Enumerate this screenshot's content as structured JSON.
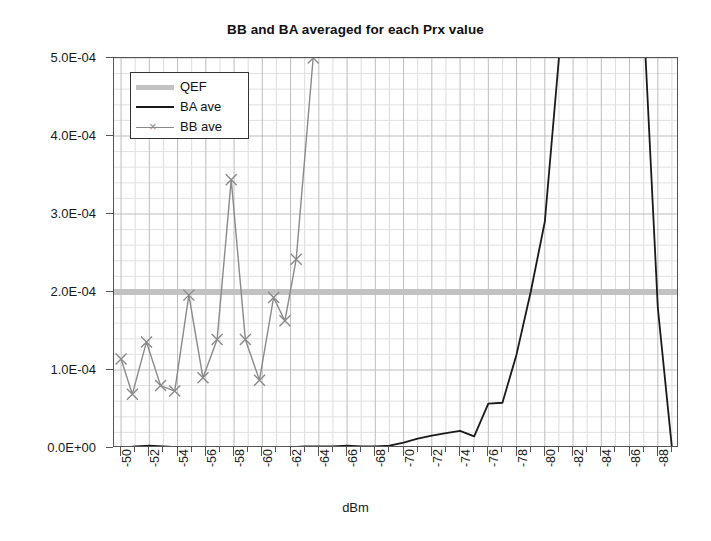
{
  "chart_data": {
    "type": "line",
    "title": "BB and BA averaged for each Prx value",
    "xlabel": "dBm",
    "ylabel": "",
    "xlim": [
      -49.5,
      -89.5
    ],
    "ylim": [
      0,
      0.0005
    ],
    "x_tick_labels": [
      "-50",
      "-52",
      "-54",
      "-56",
      "-58",
      "-60",
      "-62",
      "-64",
      "-66",
      "-68",
      "-70",
      "-72",
      "-74",
      "-76",
      "-78",
      "-80",
      "-82",
      "-84",
      "-86",
      "-88"
    ],
    "x_tick_values": [
      -50,
      -52,
      -54,
      -56,
      -58,
      -60,
      -62,
      -64,
      -66,
      -68,
      -70,
      -72,
      -74,
      -76,
      -78,
      -80,
      -82,
      -84,
      -86,
      -88
    ],
    "y_tick_labels": [
      "0.0E+00",
      "1.0E-04",
      "2.0E-04",
      "3.0E-04",
      "4.0E-04",
      "5.0E-04"
    ],
    "y_tick_values": [
      0,
      0.0001,
      0.0002,
      0.0003,
      0.0004,
      0.0005
    ],
    "grid": true,
    "legend_position": "top-left",
    "series": [
      {
        "name": "QEF",
        "style": "thick-horizontal-band",
        "color": "#c2c2c2",
        "constant_value": 0.0002,
        "x": [
          -50,
          -89
        ],
        "values": [
          0.0002,
          0.0002
        ]
      },
      {
        "name": "BA ave",
        "style": "line",
        "color": "#1a1a1a",
        "x": [
          -50,
          -51,
          -52,
          -53,
          -54,
          -55,
          -56,
          -57,
          -58,
          -59,
          -60,
          -61,
          -62,
          -63,
          -64,
          -65,
          -66,
          -67,
          -68,
          -69,
          -70,
          -71,
          -72,
          -73,
          -74,
          -75,
          -76,
          -77,
          -78,
          -79,
          -80,
          -81,
          -82,
          -83,
          -84,
          -85,
          -86,
          -87,
          -88,
          -89
        ],
        "values": [
          0.0,
          2e-06,
          3e-06,
          2e-06,
          1e-06,
          0.0,
          0.0,
          0.0,
          0.0,
          0.0,
          0.0,
          0.0,
          1e-06,
          2e-06,
          2e-06,
          2e-06,
          3e-06,
          2e-06,
          2e-06,
          3e-06,
          7e-06,
          1.2e-05,
          1.6e-05,
          1.9e-05,
          2.2e-05,
          1.5e-05,
          5.7e-05,
          5.8e-05,
          0.00012,
          0.0002,
          0.00029,
          0.0005,
          0.0007,
          0.00088,
          0.001,
          0.001,
          0.00088,
          0.00055,
          0.00018,
          0.0
        ]
      },
      {
        "name": "BB ave",
        "style": "line-markers",
        "marker": "x",
        "color": "#8a8a8a",
        "x": [
          -50,
          -50.8,
          -51.8,
          -52.8,
          -53.8,
          -54.8,
          -55.8,
          -56.8,
          -57.8,
          -58.8,
          -59.8,
          -60.8,
          -61.6,
          -62.4,
          -63.6,
          -64.4
        ],
        "values": [
          0.000114,
          6.9e-05,
          0.000136,
          8e-05,
          7.3e-05,
          0.000196,
          9e-05,
          0.000139,
          0.000344,
          0.000139,
          8.7e-05,
          0.000193,
          0.000163,
          0.000242,
          0.0005,
          0.0006
        ]
      }
    ]
  },
  "legend": {
    "items": [
      {
        "label": "QEF"
      },
      {
        "label": "BA ave"
      },
      {
        "label": "BB ave"
      }
    ]
  }
}
